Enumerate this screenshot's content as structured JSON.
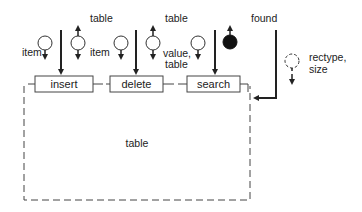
{
  "diagram": {
    "operations": [
      {
        "id": "insert",
        "label": "insert"
      },
      {
        "id": "delete",
        "label": "delete"
      },
      {
        "id": "search",
        "label": "search"
      }
    ],
    "labels": {
      "insert_in": "item",
      "insert_out": "table",
      "delete_in": "item",
      "delete_out_top": "table",
      "delete_out_value": "value,",
      "delete_out_table": "table",
      "search_out": "found",
      "create_param_1": "rectype,",
      "create_param_2": "size",
      "module_data": "table"
    },
    "colors": {
      "stroke": "#222222",
      "background": "#ffffff"
    }
  }
}
